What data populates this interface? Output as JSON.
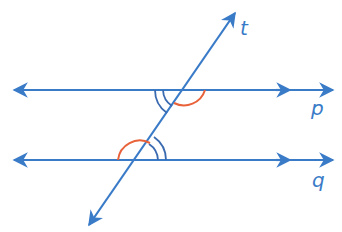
{
  "diagram": {
    "colors": {
      "line": "#3a7bc8",
      "arc_orange": "#e8623a",
      "arc_blue": "#3a6ab0",
      "label": "#3a7bc8"
    },
    "lines": [
      {
        "name": "p",
        "label": "p",
        "y": 90
      },
      {
        "name": "q",
        "label": "q",
        "y": 160
      }
    ],
    "transversal": {
      "name": "t",
      "label": "t"
    },
    "angles": [
      {
        "at": "p",
        "position": "below-left",
        "marker": "double-arc",
        "color": "blue"
      },
      {
        "at": "p",
        "position": "below-right",
        "marker": "single-arc",
        "color": "orange"
      },
      {
        "at": "q",
        "position": "above-right",
        "marker": "double-arc",
        "color": "blue"
      },
      {
        "at": "q",
        "position": "above-left",
        "marker": "single-arc",
        "color": "orange"
      }
    ]
  }
}
